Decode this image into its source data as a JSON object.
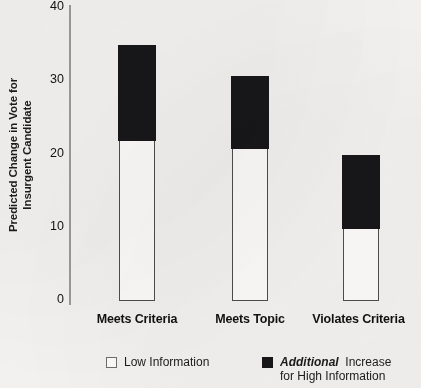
{
  "chart_data": {
    "type": "bar",
    "subtype": "stacked-column",
    "title": "",
    "xlabel": "",
    "ylabel": "Predicted Change in Vote for Insurgent Candidate",
    "ylabel_lines": [
      "Predicted Change in Vote for",
      "Insurgent Candidate"
    ],
    "ylim": [
      0,
      40
    ],
    "yticks": [
      0,
      10,
      20,
      30,
      40
    ],
    "ytick_labels": [
      "0",
      "10",
      "20",
      "30",
      "40"
    ],
    "grid": false,
    "legend_position": "bottom",
    "categories": [
      "Meets Criteria",
      "Meets Topic",
      "Violates Criteria"
    ],
    "series": [
      {
        "name": "Low Information",
        "color": "#fbfaf8",
        "values": [
          21.7,
          20.6,
          9.7
        ]
      },
      {
        "name": "Additional Increase for High Information",
        "color": "#17171a",
        "values": [
          13.1,
          10.1,
          10.1
        ]
      }
    ],
    "totals": [
      34.8,
      30.7,
      19.8
    ]
  },
  "axis": {
    "ticks": [
      "40",
      "30",
      "20",
      "10",
      "0"
    ]
  },
  "categories": [
    {
      "label": "Meets Criteria"
    },
    {
      "label": "Meets Topic"
    },
    {
      "label": "Violates Criteria"
    }
  ],
  "legend": {
    "low": {
      "label": "Low Information"
    },
    "high": {
      "emphasis": "Additional",
      "line1_rest": "Increase",
      "line2": "for High Information"
    }
  },
  "colors": {
    "background": "#f2f1ef",
    "bar_fill_low": "#fbfaf8",
    "bar_fill_high": "#17171a",
    "bar_outline": "#4d4d4d",
    "axis_line": "#9a9a98",
    "text": "#111111"
  }
}
